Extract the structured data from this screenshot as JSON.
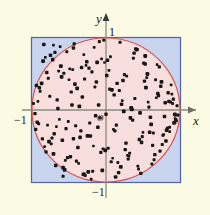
{
  "figure": {
    "background_color": "#fbfae2"
  },
  "axes": {
    "x_axis_label": "x",
    "y_axis_label": "y",
    "origin_label": "O",
    "x_ticks": [
      {
        "name": "x-neg-one",
        "label": "−1",
        "value": -1
      },
      {
        "name": "x-pos-one",
        "label": "1",
        "value": 1
      }
    ],
    "y_ticks": [
      {
        "name": "y-pos-one",
        "label": "1",
        "value": 1
      },
      {
        "name": "y-neg-one",
        "label": "−1",
        "value": -1
      }
    ],
    "axis_color": "#8a8a7e"
  },
  "shapes": {
    "square": {
      "name": "bounding-square",
      "fill_color": "#c9d4ef",
      "stroke_color": "#4f63a8",
      "x_range": [
        -1,
        1
      ],
      "y_range": [
        -1,
        1
      ]
    },
    "circle": {
      "name": "inscribed-circle",
      "fill_color": "#f8dedd",
      "stroke_color": "#d9504f",
      "center": [
        0,
        0
      ],
      "radius": 1
    },
    "points": {
      "name": "random-sample-points",
      "color": "#181814",
      "count": 300
    }
  },
  "chart_data": {
    "type": "scatter",
    "title": "",
    "xlabel": "x",
    "ylabel": "y",
    "xlim": [
      -1.0,
      1.0
    ],
    "ylim": [
      -1.0,
      1.0
    ],
    "grid": false,
    "legend": "none",
    "x": [
      -0.92,
      -0.78,
      -0.7,
      -0.61,
      -0.55,
      -0.47,
      -0.38,
      -0.3,
      -0.22,
      -0.13,
      -0.05,
      0.04,
      0.12,
      0.21,
      0.29,
      0.37,
      0.45,
      0.54,
      0.62,
      0.71,
      0.79,
      0.88,
      0.95,
      -0.96,
      -0.85,
      -0.74,
      -0.66,
      -0.58,
      -0.5,
      -0.41,
      -0.33,
      -0.25,
      -0.16,
      -0.08,
      0.01,
      0.09,
      0.18,
      0.26,
      0.34,
      0.43,
      0.51,
      0.59,
      0.68,
      0.76,
      0.84,
      0.93,
      -0.89,
      -0.81,
      -0.72,
      -0.63,
      -0.53,
      -0.44,
      -0.36,
      -0.28,
      -0.19,
      -0.11,
      -0.02,
      0.07,
      0.15,
      0.24,
      0.32,
      0.4,
      0.48,
      0.57,
      0.65,
      0.74,
      0.82,
      0.9,
      0.97,
      -0.94,
      -0.83,
      -0.76,
      -0.68,
      -0.6,
      -0.51,
      -0.43,
      -0.35,
      -0.27,
      -0.18,
      -0.1,
      -0.01,
      0.06,
      0.14,
      0.23,
      0.31,
      0.39,
      0.47,
      0.56,
      0.64,
      0.72,
      0.81,
      0.89,
      -0.91,
      -0.8,
      -0.71,
      -0.62,
      -0.54,
      -0.46,
      -0.37,
      -0.29,
      -0.21,
      -0.12,
      -0.04,
      0.05,
      0.13,
      0.22,
      0.3,
      0.38,
      0.46,
      0.55,
      0.63,
      0.7,
      0.78,
      0.87,
      0.94,
      -0.87,
      -0.79,
      -0.69,
      -0.59,
      -0.49,
      -0.4,
      -0.32,
      -0.24,
      -0.15,
      -0.07,
      0.02,
      0.1,
      0.19,
      0.27,
      0.35,
      0.44,
      0.52,
      0.6,
      0.69,
      0.77,
      0.85,
      0.92,
      -0.98,
      -0.86,
      -0.75,
      -0.67,
      -0.57,
      -0.48,
      -0.39,
      -0.31,
      -0.23,
      -0.14,
      -0.06,
      0.03,
      0.11,
      0.2,
      0.28,
      0.36,
      0.42,
      0.5,
      0.58,
      0.66,
      0.75,
      0.83,
      0.91,
      -0.93,
      -0.82,
      -0.73,
      -0.65,
      -0.56,
      -0.45,
      -0.34,
      -0.26,
      -0.17,
      -0.09,
      0.0,
      0.08,
      0.16,
      0.25,
      0.33,
      0.41,
      0.49,
      0.53,
      0.61,
      0.67,
      0.73,
      0.8,
      0.86,
      0.96,
      -0.9,
      -0.77,
      -0.64,
      -0.52,
      -0.42,
      -0.2,
      -0.03,
      0.17,
      0.53,
      0.86,
      -0.95,
      -0.84,
      -0.71,
      -0.58,
      -0.44,
      -0.3
    ],
    "y": [
      0.12,
      0.44,
      -0.33,
      0.61,
      -0.7,
      0.25,
      -0.52,
      0.77,
      -0.18,
      0.39,
      -0.84,
      0.55,
      -0.29,
      0.08,
      -0.63,
      0.72,
      -0.41,
      0.31,
      -0.75,
      0.2,
      -0.09,
      0.35,
      -0.15,
      -0.05,
      0.68,
      -0.47,
      0.14,
      -0.8,
      0.42,
      -0.22,
      0.59,
      -0.36,
      0.87,
      -0.11,
      0.48,
      -0.67,
      0.27,
      -0.55,
      0.03,
      -0.78,
      0.65,
      -0.31,
      0.17,
      -0.48,
      0.24,
      -0.06,
      0.26,
      -0.58,
      0.7,
      -0.13,
      0.81,
      -0.4,
      0.05,
      -0.91,
      0.53,
      -0.24,
      0.66,
      -0.72,
      0.37,
      -0.02,
      -0.6,
      0.85,
      -0.45,
      0.11,
      -0.69,
      0.33,
      -0.28,
      0.09,
      -0.07,
      0.34,
      -0.51,
      0.19,
      -0.77,
      0.46,
      -0.16,
      0.92,
      -0.38,
      0.62,
      -0.85,
      0.07,
      -0.56,
      0.74,
      -0.21,
      0.41,
      -0.64,
      0.16,
      -0.88,
      0.5,
      -0.32,
      0.6,
      -0.43,
      0.22,
      -0.19,
      0.52,
      -0.61,
      0.88,
      -0.26,
      0.07,
      -0.74,
      0.43,
      -0.36,
      0.66,
      -0.54,
      0.29,
      -0.93,
      0.13,
      -0.68,
      0.79,
      -0.04,
      0.45,
      -0.49,
      0.23,
      -0.34,
      0.11,
      -0.13,
      0.37,
      -0.21,
      0.8,
      -0.42,
      0.57,
      -0.71,
      0.18,
      -0.86,
      0.32,
      -0.59,
      0.69,
      -0.27,
      0.94,
      -0.46,
      0.01,
      -0.82,
      0.4,
      -0.1,
      0.63,
      -0.35,
      0.12,
      -0.18,
      0.09,
      -0.4,
      0.76,
      -0.23,
      0.51,
      -0.65,
      0.3,
      -0.9,
      0.58,
      -0.08,
      0.71,
      -0.53,
      0.21,
      -0.79,
      0.47,
      -0.14,
      0.84,
      -0.31,
      0.04,
      -0.62,
      0.39,
      -0.25,
      0.15,
      -0.17,
      0.73,
      -0.39,
      0.02,
      -0.83,
      0.56,
      -0.29,
      0.67,
      -0.5,
      0.95,
      -0.06,
      0.28,
      -0.73,
      0.49,
      -0.11,
      0.83,
      -0.37,
      0.64,
      -0.2,
      0.42,
      -0.57,
      0.1,
      -0.3,
      0.06,
      0.31,
      -0.44,
      0.54,
      -0.66,
      0.36,
      -0.96,
      0.97,
      -0.87,
      0.75,
      -0.24,
      -0.27,
      0.91,
      0.9,
      -0.92,
      0.86,
      -0.89
    ]
  }
}
